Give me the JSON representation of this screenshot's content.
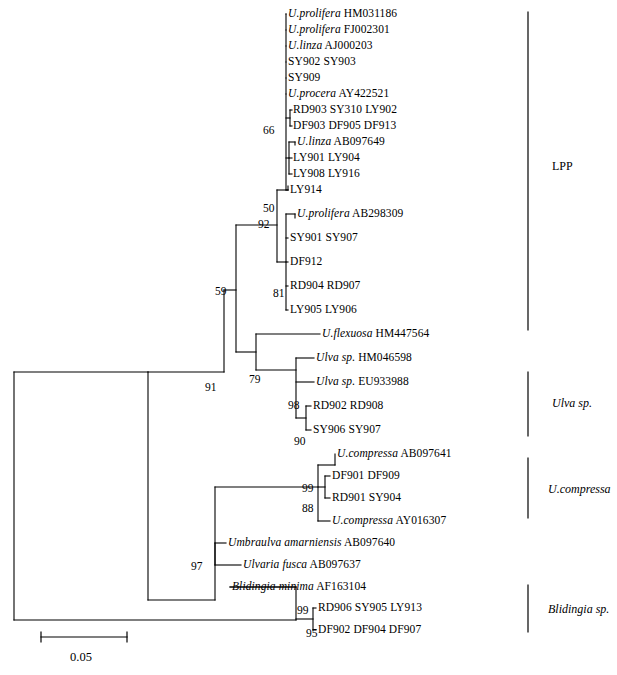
{
  "figure": {
    "type": "phylogenetic-tree",
    "width": 617,
    "height": 675,
    "background": "#ffffff",
    "line_color": "#000000"
  },
  "taxa": [
    {
      "id": "t1",
      "sci": "U.prolifera",
      "acc": "HM031186",
      "y": 14,
      "x": 288
    },
    {
      "id": "t2",
      "sci": "U.prolifera",
      "acc": "FJ002301",
      "y": 30,
      "x": 288
    },
    {
      "id": "t3",
      "sci": "U.linza",
      "acc": "AJ000203",
      "y": 46,
      "x": 288
    },
    {
      "id": "t4",
      "sci": "",
      "acc": "SY902 SY903",
      "y": 62,
      "x": 288
    },
    {
      "id": "t5",
      "sci": "",
      "acc": "SY909",
      "y": 78,
      "x": 288
    },
    {
      "id": "t6",
      "sci": "U.procera",
      "acc": "AY422521",
      "y": 94,
      "x": 288
    },
    {
      "id": "t7",
      "sci": "",
      "acc": "RD903 SY310 LY902",
      "y": 110,
      "x": 293
    },
    {
      "id": "t8",
      "sci": "",
      "acc": "DF903 DF905 DF913",
      "y": 126,
      "x": 293
    },
    {
      "id": "t9",
      "sci": "U.linza",
      "acc": "AB097649",
      "y": 142,
      "x": 297
    },
    {
      "id": "t10",
      "sci": "",
      "acc": "LY901 LY904",
      "y": 158,
      "x": 293
    },
    {
      "id": "t11",
      "sci": "",
      "acc": "LY908 LY916",
      "y": 174,
      "x": 293
    },
    {
      "id": "t12",
      "sci": "",
      "acc": "LY914",
      "y": 190,
      "x": 290
    },
    {
      "id": "t13",
      "sci": "U.prolifera",
      "acc": "AB298309",
      "y": 214,
      "x": 297
    },
    {
      "id": "t14",
      "sci": "",
      "acc": "SY901 SY907",
      "y": 238,
      "x": 290
    },
    {
      "id": "t15",
      "sci": "",
      "acc": "DF912",
      "y": 262,
      "x": 290
    },
    {
      "id": "t16",
      "sci": "",
      "acc": "RD904 RD907",
      "y": 286,
      "x": 290
    },
    {
      "id": "t17",
      "sci": "",
      "acc": "LY905 LY906",
      "y": 310,
      "x": 290
    },
    {
      "id": "t18",
      "sci": "U.flexuosa",
      "acc": "HM447564",
      "y": 334,
      "x": 322
    },
    {
      "id": "t19",
      "sci": "Ulva sp.",
      "acc": "HM046598",
      "y": 358,
      "x": 316
    },
    {
      "id": "t20",
      "sci": "Ulva sp.",
      "acc": "EU933988",
      "y": 382,
      "x": 316
    },
    {
      "id": "t21",
      "sci": "",
      "acc": "RD902 RD908",
      "y": 406,
      "x": 313
    },
    {
      "id": "t22",
      "sci": "",
      "acc": "SY906 SY907",
      "y": 430,
      "x": 313
    },
    {
      "id": "t23",
      "sci": "U.compressa",
      "acc": "AB097641",
      "y": 454,
      "x": 337
    },
    {
      "id": "t24",
      "sci": "",
      "acc": "DF901 DF909",
      "y": 476,
      "x": 332
    },
    {
      "id": "t25",
      "sci": "",
      "acc": "RD901 SY904",
      "y": 498,
      "x": 332
    },
    {
      "id": "t26",
      "sci": "U.compressa",
      "acc": "AY016307",
      "y": 521,
      "x": 332
    },
    {
      "id": "t27",
      "sci": "Umbraulva amarniensis",
      "acc": "AB097640",
      "y": 543,
      "x": 228
    },
    {
      "id": "t28",
      "sci": "Ulvaria fusca",
      "acc": "AB097637",
      "y": 565,
      "x": 243
    },
    {
      "id": "t29",
      "sci": "Blidingia minima",
      "acc": "AF163104",
      "y": 587,
      "x": 232
    },
    {
      "id": "t30",
      "sci": "",
      "acc": "RD906 SY905 LY913",
      "y": 608,
      "x": 318
    },
    {
      "id": "t31",
      "sci": "",
      "acc": "DF902 DF904 DF907",
      "y": 630,
      "x": 318
    }
  ],
  "support_values": [
    {
      "id": "s66",
      "value": "66",
      "x": 263,
      "y": 131
    },
    {
      "id": "s50",
      "value": "50",
      "x": 263,
      "y": 209
    },
    {
      "id": "s92",
      "value": "92",
      "x": 258,
      "y": 225
    },
    {
      "id": "s81",
      "value": "81",
      "x": 273,
      "y": 294
    },
    {
      "id": "s59",
      "value": "59",
      "x": 215,
      "y": 292
    },
    {
      "id": "s79",
      "value": "79",
      "x": 249,
      "y": 380
    },
    {
      "id": "s98",
      "value": "98",
      "x": 288,
      "y": 406
    },
    {
      "id": "s90",
      "value": "90",
      "x": 294,
      "y": 442
    },
    {
      "id": "s91",
      "value": "91",
      "x": 205,
      "y": 388
    },
    {
      "id": "s99c",
      "value": "99",
      "x": 302,
      "y": 489
    },
    {
      "id": "s88",
      "value": "88",
      "x": 302,
      "y": 509
    },
    {
      "id": "s97",
      "value": "97",
      "x": 191,
      "y": 567
    },
    {
      "id": "s99b",
      "value": "99",
      "x": 297,
      "y": 611
    },
    {
      "id": "s95",
      "value": "95",
      "x": 306,
      "y": 634
    }
  ],
  "clade_brackets": [
    {
      "id": "lpp",
      "label": "LPP",
      "italic": false,
      "x": 528,
      "y_top": 12,
      "y_bottom": 330,
      "label_x": 552,
      "label_y": 166
    },
    {
      "id": "ulva_sp",
      "label": "Ulva sp.",
      "italic": true,
      "x": 528,
      "y_top": 372,
      "y_bottom": 436,
      "label_x": 552,
      "label_y": 403
    },
    {
      "id": "u_compressa",
      "label": "U.compressa",
      "italic": true,
      "x": 528,
      "y_top": 458,
      "y_bottom": 518,
      "label_x": 548,
      "label_y": 489
    },
    {
      "id": "blidingia_sp",
      "label": "Blidingia sp.",
      "italic": true,
      "x": 528,
      "y_top": 585,
      "y_bottom": 632,
      "label_x": 548,
      "label_y": 609
    }
  ],
  "scale_bar": {
    "label": "0.05",
    "x_start": 41,
    "x_end": 127,
    "y": 637,
    "tick_height": 10,
    "label_x": 84,
    "label_y": 657
  },
  "tree_edges": [
    {
      "id": "root-v",
      "x1": 14,
      "y1": 372,
      "x2": 14,
      "y2": 620
    },
    {
      "id": "root-up",
      "x1": 14,
      "y1": 372,
      "x2": 148,
      "y2": 372
    },
    {
      "id": "root-down",
      "x1": 14,
      "y1": 620,
      "x2": 296,
      "y2": 620
    },
    {
      "id": "n-a-v",
      "x1": 148,
      "y1": 372,
      "x2": 148,
      "y2": 600
    },
    {
      "id": "n-a-top",
      "x1": 148,
      "y1": 372,
      "x2": 224,
      "y2": 372
    },
    {
      "id": "n-a-bot",
      "x1": 148,
      "y1": 600,
      "x2": 215,
      "y2": 600
    },
    {
      "id": "n91-v",
      "x1": 224,
      "y1": 290,
      "x2": 224,
      "y2": 372
    },
    {
      "id": "n91-top",
      "x1": 224,
      "y1": 290,
      "x2": 236,
      "y2": 290
    },
    {
      "id": "n59-v",
      "x1": 236,
      "y1": 225,
      "x2": 236,
      "y2": 352
    },
    {
      "id": "n59-up",
      "x1": 236,
      "y1": 225,
      "x2": 277,
      "y2": 225
    },
    {
      "id": "n59-dn",
      "x1": 236,
      "y1": 352,
      "x2": 256,
      "y2": 352
    },
    {
      "id": "n92-v",
      "x1": 277,
      "y1": 190,
      "x2": 277,
      "y2": 262
    },
    {
      "id": "n92-a",
      "x1": 277,
      "y1": 190,
      "x2": 288,
      "y2": 190
    },
    {
      "id": "n92-b",
      "x1": 277,
      "y1": 262,
      "x2": 286,
      "y2": 262
    },
    {
      "id": "poly1-v",
      "x1": 286,
      "y1": 14,
      "x2": 286,
      "y2": 190
    },
    {
      "id": "l1",
      "x1": 286,
      "y1": 14,
      "x2": 286,
      "y2": 14
    },
    {
      "id": "l2",
      "x1": 286,
      "y1": 30,
      "x2": 286,
      "y2": 30
    },
    {
      "id": "l3",
      "x1": 286,
      "y1": 46,
      "x2": 286,
      "y2": 46
    },
    {
      "id": "l4",
      "x1": 286,
      "y1": 62,
      "x2": 286,
      "y2": 62
    },
    {
      "id": "l5",
      "x1": 286,
      "y1": 78,
      "x2": 286,
      "y2": 78
    },
    {
      "id": "l6",
      "x1": 286,
      "y1": 94,
      "x2": 286,
      "y2": 94
    },
    {
      "id": "n66-h",
      "x1": 286,
      "y1": 118,
      "x2": 290,
      "y2": 118
    },
    {
      "id": "n66-v",
      "x1": 290,
      "y1": 110,
      "x2": 290,
      "y2": 126
    },
    {
      "id": "n66-t1",
      "x1": 290,
      "y1": 110,
      "x2": 292,
      "y2": 110
    },
    {
      "id": "n66-t2",
      "x1": 290,
      "y1": 126,
      "x2": 292,
      "y2": 126
    },
    {
      "id": "n50-h",
      "x1": 286,
      "y1": 158,
      "x2": 289,
      "y2": 158
    },
    {
      "id": "n50-v",
      "x1": 289,
      "y1": 142,
      "x2": 289,
      "y2": 174
    },
    {
      "id": "n50-t1",
      "x1": 289,
      "y1": 142,
      "x2": 295,
      "y2": 142
    },
    {
      "id": "n50-t1b",
      "x1": 295,
      "y1": 142,
      "x2": 295,
      "y2": 145
    },
    {
      "id": "n50-t2",
      "x1": 289,
      "y1": 158,
      "x2": 292,
      "y2": 158
    },
    {
      "id": "n50-t3",
      "x1": 289,
      "y1": 174,
      "x2": 292,
      "y2": 174
    },
    {
      "id": "l12-h",
      "x1": 286,
      "y1": 190,
      "x2": 288,
      "y2": 190
    },
    {
      "id": "l12-v",
      "x1": 288,
      "y1": 186,
      "x2": 288,
      "y2": 190
    },
    {
      "id": "n81-v",
      "x1": 286,
      "y1": 214,
      "x2": 286,
      "y2": 310
    },
    {
      "id": "n81-t1",
      "x1": 286,
      "y1": 214,
      "x2": 295,
      "y2": 214
    },
    {
      "id": "n81-t1b",
      "x1": 295,
      "y1": 214,
      "x2": 295,
      "y2": 218
    },
    {
      "id": "n81-t2",
      "x1": 286,
      "y1": 238,
      "x2": 288,
      "y2": 238
    },
    {
      "id": "n81-t3",
      "x1": 286,
      "y1": 262,
      "x2": 288,
      "y2": 262
    },
    {
      "id": "n81-t4",
      "x1": 286,
      "y1": 286,
      "x2": 288,
      "y2": 286
    },
    {
      "id": "n81-t5",
      "x1": 286,
      "y1": 310,
      "x2": 288,
      "y2": 310
    },
    {
      "id": "n79-v",
      "x1": 256,
      "y1": 334,
      "x2": 256,
      "y2": 370
    },
    {
      "id": "n79-top",
      "x1": 256,
      "y1": 334,
      "x2": 320,
      "y2": 334
    },
    {
      "id": "n79-bot",
      "x1": 256,
      "y1": 370,
      "x2": 296,
      "y2": 370
    },
    {
      "id": "n98-v",
      "x1": 296,
      "y1": 358,
      "x2": 296,
      "y2": 418
    },
    {
      "id": "n98-t1",
      "x1": 296,
      "y1": 358,
      "x2": 314,
      "y2": 358
    },
    {
      "id": "n98-t2",
      "x1": 296,
      "y1": 382,
      "x2": 314,
      "y2": 382
    },
    {
      "id": "n90-v",
      "x1": 306,
      "y1": 406,
      "x2": 306,
      "y2": 430
    },
    {
      "id": "n90-h",
      "x1": 296,
      "y1": 418,
      "x2": 306,
      "y2": 418
    },
    {
      "id": "n90-t1",
      "x1": 306,
      "y1": 406,
      "x2": 311,
      "y2": 406
    },
    {
      "id": "n90-t2",
      "x1": 306,
      "y1": 430,
      "x2": 311,
      "y2": 430
    },
    {
      "id": "n-c-v",
      "x1": 215,
      "y1": 487,
      "x2": 215,
      "y2": 600
    },
    {
      "id": "n-c-top",
      "x1": 215,
      "y1": 487,
      "x2": 318,
      "y2": 487
    },
    {
      "id": "n99c-v",
      "x1": 318,
      "y1": 465,
      "x2": 318,
      "y2": 521
    },
    {
      "id": "n99c-t1",
      "x1": 318,
      "y1": 465,
      "x2": 335,
      "y2": 465
    },
    {
      "id": "n99c-t1b",
      "x1": 335,
      "y1": 454,
      "x2": 335,
      "y2": 465
    },
    {
      "id": "n99c-t4",
      "x1": 318,
      "y1": 521,
      "x2": 330,
      "y2": 521
    },
    {
      "id": "n88-v",
      "x1": 325,
      "y1": 476,
      "x2": 325,
      "y2": 498
    },
    {
      "id": "n88-h",
      "x1": 318,
      "y1": 487,
      "x2": 325,
      "y2": 487
    },
    {
      "id": "n88-t1",
      "x1": 325,
      "y1": 476,
      "x2": 330,
      "y2": 476
    },
    {
      "id": "n88-t2",
      "x1": 325,
      "y1": 498,
      "x2": 330,
      "y2": 498
    },
    {
      "id": "n97-v",
      "x1": 215,
      "y1": 543,
      "x2": 215,
      "y2": 565
    },
    {
      "id": "n97-t1",
      "x1": 215,
      "y1": 543,
      "x2": 226,
      "y2": 543
    },
    {
      "id": "n97-t2",
      "x1": 215,
      "y1": 565,
      "x2": 241,
      "y2": 565
    },
    {
      "id": "n99b-v",
      "x1": 296,
      "y1": 587,
      "x2": 296,
      "y2": 620
    },
    {
      "id": "n99b-t1",
      "x1": 296,
      "y1": 587,
      "x2": 230,
      "y2": 587
    },
    {
      "id": "n99b-t1x",
      "x1": 230,
      "y1": 587,
      "x2": 296,
      "y2": 587
    },
    {
      "id": "n95-v",
      "x1": 313,
      "y1": 608,
      "x2": 313,
      "y2": 630
    },
    {
      "id": "n95-h",
      "x1": 296,
      "y1": 619,
      "x2": 313,
      "y2": 619
    },
    {
      "id": "n95-t1",
      "x1": 313,
      "y1": 608,
      "x2": 316,
      "y2": 608
    },
    {
      "id": "n95-t2",
      "x1": 313,
      "y1": 630,
      "x2": 316,
      "y2": 630
    }
  ]
}
